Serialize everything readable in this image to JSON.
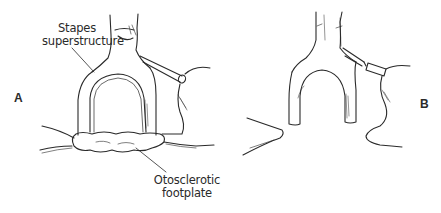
{
  "figure": {
    "panels": [
      {
        "id": "A",
        "letter": "A",
        "labels": {
          "superstructure": [
            "Stapes",
            "superstructure"
          ],
          "footplate": [
            "Otosclerotic",
            "footplate"
          ]
        }
      },
      {
        "id": "B",
        "letter": "B"
      }
    ]
  },
  "colors": {
    "line": "#2a2a2a",
    "background": "#ffffff"
  }
}
